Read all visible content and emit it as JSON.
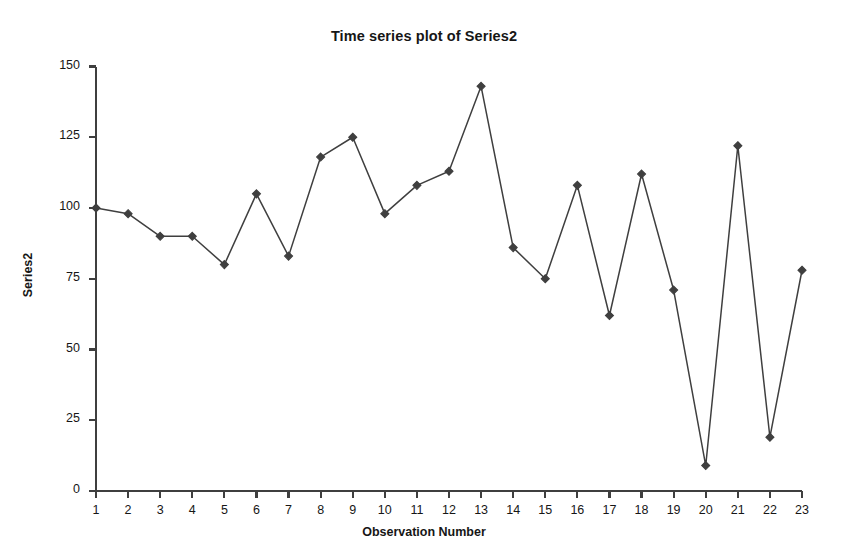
{
  "chart_data": {
    "type": "line",
    "title": "Time series plot of Series2",
    "xlabel": "Observation Number",
    "ylabel": "Series2",
    "grid": false,
    "legend": false,
    "marker": "diamond",
    "line_style": "solid",
    "color": "#3f3f3f",
    "x": [
      1,
      2,
      3,
      4,
      5,
      6,
      7,
      8,
      9,
      10,
      11,
      12,
      13,
      14,
      15,
      16,
      17,
      18,
      19,
      20,
      21,
      22,
      23
    ],
    "values": [
      100,
      98,
      90,
      90,
      80,
      105,
      83,
      118,
      125,
      98,
      108,
      113,
      143,
      86,
      75,
      108,
      62,
      112,
      71,
      9,
      122,
      19,
      78
    ],
    "xlim": [
      1,
      23
    ],
    "ylim": [
      0,
      150
    ],
    "ytick_labels": [
      "150",
      "125",
      "100",
      "75",
      "50",
      "25",
      "0"
    ],
    "yticks": [
      150,
      125,
      100,
      75,
      50,
      25,
      0
    ],
    "xtick_labels": [
      "1",
      "2",
      "3",
      "4",
      "5",
      "6",
      "7",
      "8",
      "9",
      "10",
      "11",
      "12",
      "13",
      "14",
      "15",
      "16",
      "17",
      "18",
      "19",
      "20",
      "21",
      "22",
      "23"
    ]
  },
  "axes": {
    "axis_color": "#3f3f3f",
    "text_color": "#161616"
  }
}
